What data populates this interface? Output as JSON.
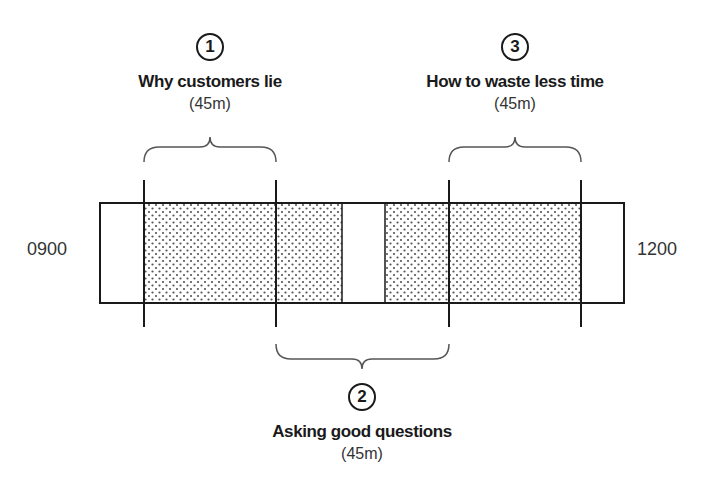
{
  "diagram": {
    "start_time": "0900",
    "end_time": "1200",
    "sessions": [
      {
        "number": "1",
        "title": "Why customers lie",
        "duration": "(45m)"
      },
      {
        "number": "2",
        "title": "Asking good questions",
        "duration": "(45m)"
      },
      {
        "number": "3",
        "title": "How to waste less time",
        "duration": "(45m)"
      }
    ],
    "colors": {
      "stroke": "#1a1a1a",
      "dots": "#555555",
      "background": "#ffffff"
    }
  }
}
